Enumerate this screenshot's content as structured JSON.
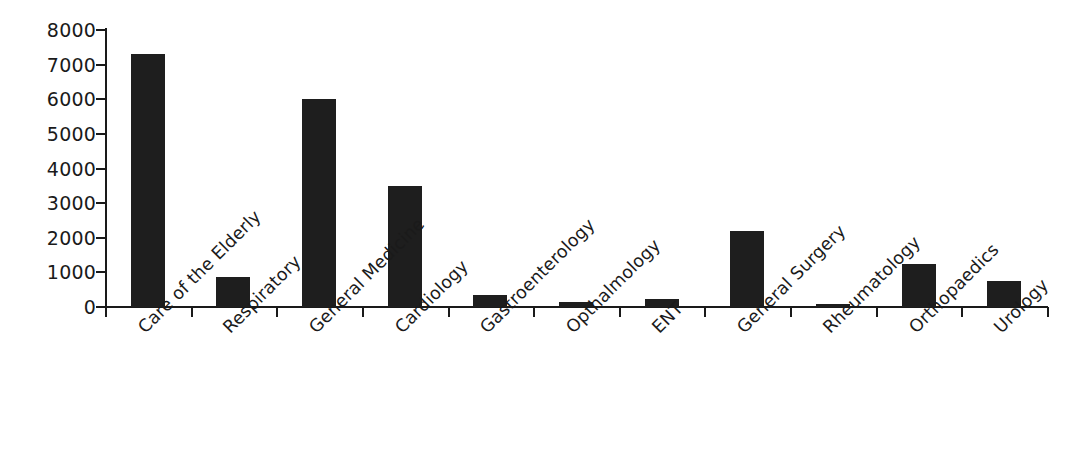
{
  "chart_data": {
    "type": "bar",
    "title": "",
    "subtitle": "",
    "xlabel": "",
    "ylabel": "",
    "categories": [
      "Care of the Elderly",
      "Respiratory",
      "General Medicine",
      "Cardiology",
      "Gastroenterology",
      "Opthalmology",
      "ENT",
      "General Surgery",
      "Rheumatology",
      "Orthopaedics",
      "Urology"
    ],
    "values": [
      7300,
      870,
      6020,
      3500,
      350,
      150,
      240,
      2190,
      90,
      1250,
      760
    ],
    "ylim": [
      0,
      8000
    ],
    "ytick_labels": [
      "0",
      "1000",
      "2000",
      "3000",
      "4000",
      "5000",
      "6000",
      "7000",
      "8000"
    ],
    "ytick_values": [
      0,
      1000,
      2000,
      3000,
      4000,
      5000,
      6000,
      7000,
      8000
    ],
    "grid": false,
    "legend": false,
    "legend_position": "none",
    "bar_color": "#1e1e1e",
    "axis_color": "#1a1a1a",
    "background_color": "#ffffff",
    "label_rotation_degrees": -45
  }
}
